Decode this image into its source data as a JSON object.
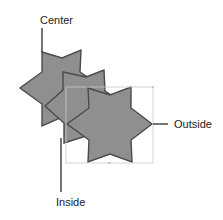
{
  "diagram": {
    "labels": {
      "center": "Center",
      "inside": "Inside",
      "outside": "Outside"
    },
    "colors": {
      "fill": "#8f8f8f",
      "stroke": "#4a4a4a",
      "leader": "#1a1a1a",
      "selection": "#c8c8c8"
    },
    "stars": [
      {
        "name": "star-center",
        "cx": 62,
        "cy": 89
      },
      {
        "name": "star-inside",
        "cx": 86,
        "cy": 107
      },
      {
        "name": "star-outside",
        "cx": 110,
        "cy": 124
      }
    ]
  }
}
